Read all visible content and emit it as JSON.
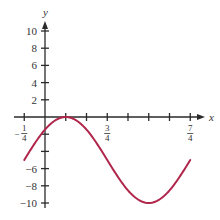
{
  "chart_data": {
    "type": "line",
    "title": "",
    "xlabel": "x",
    "ylabel": "y",
    "function": "y = 5cos(π(x − 1/4)) − 5",
    "xlim": [
      -0.25,
      1.75
    ],
    "ylim": [
      -10,
      10
    ],
    "grid": false,
    "legend": "none",
    "x_ticks": [
      -0.25,
      0.25,
      0.5,
      0.75,
      1.0,
      1.25,
      1.5,
      1.75
    ],
    "x_tick_labels": [
      {
        "value": -0.25,
        "sign": "−",
        "num": "1",
        "den": "4"
      },
      {
        "value": 0.75,
        "sign": "",
        "num": "3",
        "den": "4"
      },
      {
        "value": 1.75,
        "sign": "",
        "num": "7",
        "den": "4"
      }
    ],
    "y_ticks": [
      -10,
      -8,
      -6,
      -4,
      -2,
      2,
      4,
      6,
      8,
      10
    ],
    "y_tick_labels": [
      {
        "value": 10,
        "text": "10"
      },
      {
        "value": 8,
        "text": "8"
      },
      {
        "value": 6,
        "text": "6"
      },
      {
        "value": 4,
        "text": "4"
      },
      {
        "value": 2,
        "text": "2"
      },
      {
        "value": -6,
        "text": "−6"
      },
      {
        "value": -8,
        "text": "−8"
      },
      {
        "value": -10,
        "text": "−10"
      }
    ],
    "series": [
      {
        "name": "curve",
        "color": "#b0254a",
        "x": [
          -0.25,
          0,
          0.25,
          0.5,
          0.75,
          1.0,
          1.25,
          1.5,
          1.75
        ],
        "y": [
          -5,
          -1.46,
          0,
          -1.46,
          -5,
          -8.54,
          -10,
          -8.54,
          -5
        ]
      }
    ]
  }
}
